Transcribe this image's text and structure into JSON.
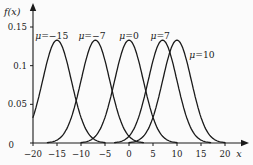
{
  "chart_data": {
    "type": "line",
    "title": "",
    "ylabel": "f(x)",
    "xlabel": "x",
    "xlim": [
      -20,
      23.5
    ],
    "ylim": [
      0,
      0.172
    ],
    "grid": false,
    "legend": "none",
    "sigma": 3,
    "peak_density": 0.133,
    "x_ticks": [
      {
        "value": -20,
        "label": "−20"
      },
      {
        "value": -15,
        "label": "−15"
      },
      {
        "value": -10,
        "label": "−10"
      },
      {
        "value": -5,
        "label": "−5"
      },
      {
        "value": 0,
        "label": "0"
      },
      {
        "value": 5,
        "label": "5"
      },
      {
        "value": 10,
        "label": "10"
      },
      {
        "value": 15,
        "label": "15"
      },
      {
        "value": 20,
        "label": "20"
      }
    ],
    "y_ticks": [
      {
        "value": 0,
        "label": "0"
      },
      {
        "value": 0.05,
        "label": "0.05"
      },
      {
        "value": 0.1,
        "label": "0.1"
      },
      {
        "value": 0.15,
        "label": "0.15"
      }
    ],
    "series": [
      {
        "name": "mu-minus-15",
        "mean": -15,
        "label": "μ=−15",
        "label_x": -16.1,
        "label_y": 0.138
      },
      {
        "name": "mu-minus-7",
        "mean": -7,
        "label": "μ=−7",
        "label_x": -7.7,
        "label_y": 0.138
      },
      {
        "name": "mu-0",
        "mean": 0,
        "label": "μ=0",
        "label_x": 0.0,
        "label_y": 0.138
      },
      {
        "name": "mu-7",
        "mean": 7,
        "label": "μ=7",
        "label_x": 6.5,
        "label_y": 0.138
      },
      {
        "name": "mu-10",
        "mean": 10,
        "label": "μ=10",
        "label_x": 15.2,
        "label_y": 0.114
      }
    ],
    "line_color": "#1a1a1a",
    "axis_color": "#1a1a1a"
  }
}
